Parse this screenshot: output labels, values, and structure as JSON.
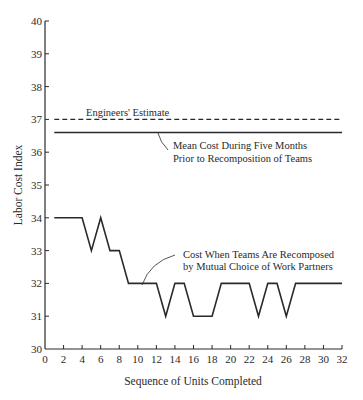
{
  "chart_data": {
    "type": "line",
    "title": "",
    "xlabel": "Sequence of Units Completed",
    "ylabel": "Labor Cost Index",
    "xlim": [
      0,
      32
    ],
    "ylim": [
      30,
      40
    ],
    "grid": false,
    "legend": "none (inline annotations)",
    "x_ticks": [
      0,
      2,
      4,
      6,
      8,
      10,
      12,
      14,
      16,
      18,
      20,
      22,
      24,
      26,
      28,
      30,
      32
    ],
    "y_ticks": [
      30,
      31,
      32,
      33,
      34,
      35,
      36,
      37,
      38,
      39,
      40
    ],
    "series": [
      {
        "name": "Cost When Teams Are Recomposed by Mutual Choice of Work Partners",
        "style": "solid",
        "x": [
          1,
          4,
          5,
          6,
          7,
          8,
          9,
          12,
          13,
          14,
          15,
          16,
          18,
          19,
          22,
          23,
          24,
          25,
          26,
          27,
          32
        ],
        "values": [
          34,
          34,
          33,
          34,
          33,
          33,
          32,
          32,
          31,
          32,
          32,
          31,
          31,
          32,
          32,
          31,
          32,
          32,
          31,
          32,
          32
        ]
      },
      {
        "name": "Engineers' Estimate",
        "style": "dashed",
        "x": [
          1,
          32
        ],
        "values": [
          37,
          37
        ]
      },
      {
        "name": "Mean Cost During Five Months Prior to Recomposition of Teams",
        "style": "solid",
        "x": [
          1,
          32
        ],
        "values": [
          36.6,
          36.6
        ]
      }
    ],
    "annotations": [
      {
        "text": "Engineers' Estimate",
        "target": "dashed line at 37"
      },
      {
        "text_lines": [
          "Mean Cost During Five Months",
          "Prior to Recomposition of Teams"
        ],
        "target": "solid line at ~36.6"
      },
      {
        "text_lines": [
          "Cost When Teams Are Recomposed",
          "by Mutual Choice of Work Partners"
        ],
        "target": "data line near unit 10"
      }
    ]
  },
  "labels": {
    "x_axis_title": "Sequence of Units Completed",
    "y_axis_title": "Labor Cost Index",
    "engineers_estimate": "Engineers' Estimate",
    "mean_cost_line1": "Mean Cost During Five Months",
    "mean_cost_line2": "Prior to Recomposition of Teams",
    "recomposed_line1": "Cost When Teams Are Recomposed",
    "recomposed_line2": "by Mutual Choice of Work Partners"
  },
  "colors": {
    "ink": "#2a2a2a",
    "background": "#ffffff"
  }
}
